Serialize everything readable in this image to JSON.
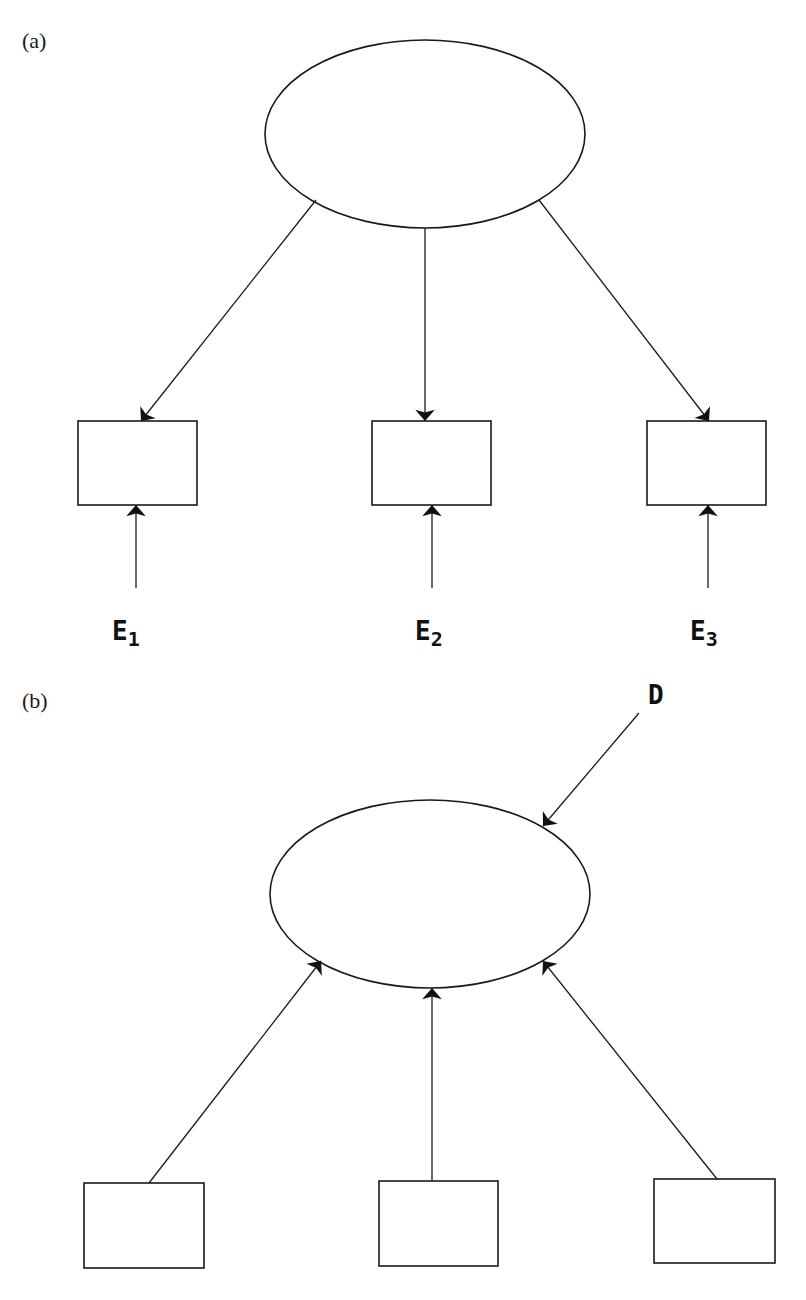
{
  "panels": {
    "a": {
      "label": "(a)",
      "type": "reflective-measurement-model",
      "latent": {
        "cx": 425,
        "cy": 134,
        "rx": 160,
        "ry": 94
      },
      "indicators": [
        {
          "x": 78,
          "y": 421,
          "w": 119,
          "h": 84,
          "error_label_main": "E",
          "error_label_sub": "1"
        },
        {
          "x": 372,
          "y": 421,
          "w": 119,
          "h": 84,
          "error_label_main": "E",
          "error_label_sub": "2"
        },
        {
          "x": 647,
          "y": 421,
          "w": 119,
          "h": 84,
          "error_label_main": "E",
          "error_label_sub": "3"
        }
      ]
    },
    "b": {
      "label": "(b)",
      "type": "formative-measurement-model",
      "latent": {
        "cx": 430,
        "cy": 894,
        "rx": 160,
        "ry": 94
      },
      "disturbance_label": "D",
      "indicators": [
        {
          "x": 84,
          "y": 1183,
          "w": 120,
          "h": 85
        },
        {
          "x": 379,
          "y": 1181,
          "w": 119,
          "h": 85
        },
        {
          "x": 654,
          "y": 1179,
          "w": 121,
          "h": 84
        }
      ]
    }
  },
  "colors": {
    "stroke": "#1a1a1a",
    "background": "#ffffff"
  }
}
